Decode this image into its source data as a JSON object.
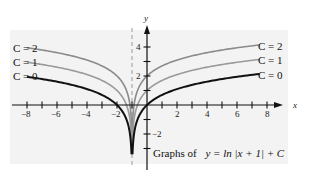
{
  "chart_data": {
    "type": "line",
    "xlabel": "x",
    "ylabel": "y",
    "xlim": [
      -9,
      9
    ],
    "ylim": [
      -4,
      5
    ],
    "grid": false,
    "asymptote": {
      "x": -1,
      "style": "dashed"
    },
    "x_ticks": [
      -8,
      -7,
      -6,
      -5,
      -4,
      -3,
      -2,
      -1,
      1,
      2,
      3,
      4,
      5,
      6,
      7,
      8
    ],
    "x_tick_labels": [
      "-8",
      "-6",
      "-4",
      "-2",
      "2",
      "4",
      "6",
      "8"
    ],
    "y_ticks": [
      -3,
      -2,
      -1,
      1,
      2,
      3,
      4
    ],
    "y_tick_labels": [
      "-2",
      "2",
      "4"
    ],
    "function": "ln|x + 1| + C",
    "series": [
      {
        "name": "C = 2",
        "C": 2,
        "color": "#8a8a8a"
      },
      {
        "name": "C = 1",
        "C": 1,
        "color": "#9a9a9a"
      },
      {
        "name": "C = 0",
        "C": 0,
        "color": "#111111"
      }
    ],
    "left_labels": [
      "C = 2",
      "C = 1",
      "C = 0"
    ],
    "right_labels": [
      "C = 2",
      "C = 1",
      "C = 0"
    ]
  },
  "caption": {
    "prefix": "Graphs of",
    "formula": "y = ln |x + 1| + C"
  },
  "labels": {
    "x_axis": "x",
    "y_axis": "y",
    "tick_neg8": "−8",
    "tick_neg6": "−6",
    "tick_neg4": "−4",
    "tick_neg2": "−2",
    "tick_2": "2",
    "tick_4": "4",
    "tick_6": "6",
    "tick_8": "8",
    "ytick_4": "4",
    "ytick_2": "2",
    "ytick_neg2": "−2",
    "c2": "C = 2",
    "c1": "C = 1",
    "c0": "C = 0"
  }
}
